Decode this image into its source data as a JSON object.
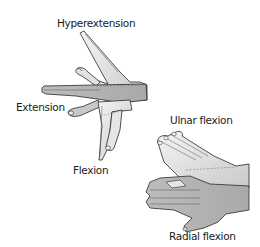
{
  "figure": {
    "labels": {
      "hyperextension": "Hyperextension",
      "extension": "Extension",
      "flexion": "Flexion",
      "ulnar_flexion": "Ulnar flexion",
      "radial_flexion": "Radial flexion"
    },
    "colors": {
      "background": "#ffffff",
      "skin_dark": "#b5b5b5",
      "skin_mid": "#cfcfcf",
      "skin_light": "#ececec",
      "outline": "#2a2a2a",
      "text": "#1a1a1a"
    }
  }
}
